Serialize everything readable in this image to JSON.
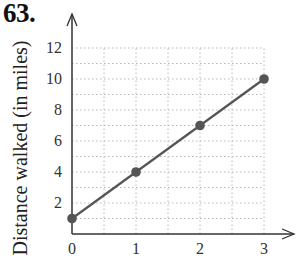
{
  "problem_number": "63.",
  "chart_data": {
    "type": "line",
    "title": "",
    "xlabel": "",
    "ylabel": "Distance walked (in miles)",
    "x": [
      0,
      1,
      2,
      3
    ],
    "series": [
      {
        "name": "Distance walked",
        "values": [
          1,
          4,
          7,
          10
        ],
        "color": "#555555",
        "markers": true
      }
    ],
    "x_ticks": [
      "0",
      "1",
      "2",
      "3"
    ],
    "y_ticks": [
      "2",
      "4",
      "6",
      "8",
      "10",
      "12"
    ],
    "xlim": [
      0,
      3
    ],
    "ylim": [
      0,
      12
    ],
    "grid": true,
    "grid_style": "dotted",
    "grid_x_step": 0.5,
    "grid_y_step": 1,
    "legend": null
  }
}
